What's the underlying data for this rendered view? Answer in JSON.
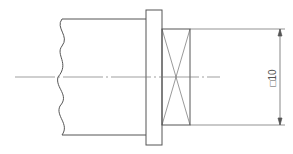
{
  "drawing": {
    "type": "technical-drawing",
    "description": "Shaft end with flange and square-section end (cross-hatched flat)",
    "dimension": {
      "symbol": "square",
      "value": "10",
      "label": "□10"
    },
    "colors": {
      "line": "#555555",
      "centerline": "#777777",
      "background": "#ffffff"
    }
  }
}
